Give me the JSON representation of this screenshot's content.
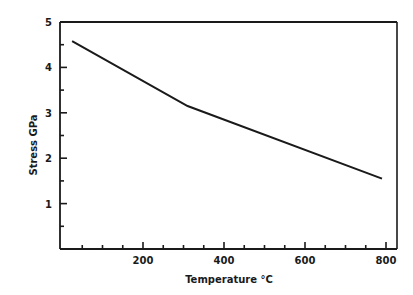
{
  "chart_data": {
    "type": "line",
    "title": "",
    "xlabel": "Temperature °C",
    "ylabel": "Stress GPa",
    "xlim": [
      0,
      830
    ],
    "ylim": [
      0,
      5
    ],
    "x_ticks_major": [
      200,
      400,
      600,
      800
    ],
    "x_tick_labels": [
      "200",
      "400",
      "600",
      "800"
    ],
    "x_minor_step": 50,
    "y_ticks_major": [
      1,
      2,
      3,
      4,
      5
    ],
    "y_tick_labels": [
      "1",
      "2",
      "3",
      "4",
      "5"
    ],
    "y_minor_step": 0.5,
    "grid": false,
    "legend": null,
    "series": [
      {
        "name": "Stress",
        "x": [
          25,
          310,
          790
        ],
        "y": [
          4.58,
          3.15,
          1.55
        ]
      }
    ]
  },
  "labels": {
    "xlabel": "Temperature °C",
    "ylabel": "Stress GPa",
    "xticks": [
      "200",
      "400",
      "600",
      "800"
    ],
    "yticks": [
      "1",
      "2",
      "3",
      "4",
      "5"
    ]
  }
}
